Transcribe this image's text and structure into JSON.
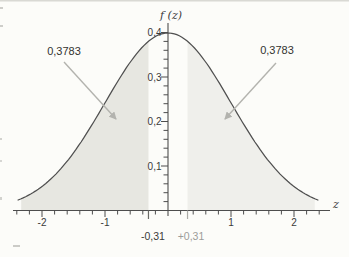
{
  "chart_data": {
    "type": "area",
    "title": "",
    "curve_name": "standard normal density",
    "mean": 0,
    "sd": 1,
    "peak": 0.3989,
    "xlabel": "z",
    "ylabel": "f (z)",
    "xlim": [
      -2.5,
      2.6
    ],
    "ylim": [
      0,
      0.42
    ],
    "curve_x_range": [
      -2.38,
      2.38
    ],
    "x_minor_step": 0.2,
    "y_minor_step": 0.02,
    "x_major_ticks": [
      {
        "value": -2,
        "label": "-2"
      },
      {
        "value": -1,
        "label": "-1"
      },
      {
        "value": 1,
        "label": "1"
      },
      {
        "value": 2,
        "label": "2"
      }
    ],
    "y_major_ticks": [
      {
        "value": 0.1,
        "label": "0,1"
      },
      {
        "value": 0.2,
        "label": "0,2"
      },
      {
        "value": 0.3,
        "label": "0,3"
      },
      {
        "value": 0.4,
        "label": "0,4"
      }
    ],
    "boundaries": [
      {
        "z": -0.31,
        "label": "-0,31",
        "tick_color": "#6a6a66",
        "label_color": "#3a3a3a"
      },
      {
        "z": 0.31,
        "label": "+0,31",
        "tick_color": "#ababa7",
        "label_color": "#9c9c99"
      }
    ],
    "shaded_regions": [
      {
        "from": -2.33,
        "to": -0.31,
        "area": 0.3783,
        "label": "0,3783",
        "fill": "#e7e7e1"
      },
      {
        "from": 0.31,
        "to": 2.33,
        "area": 0.3783,
        "label": "0,3783",
        "fill": "#efefeb"
      }
    ],
    "colors": {
      "background": "#fcfcf9",
      "curve": "#4f4f4f",
      "axis": "#4d4d4d",
      "arrow": "#b3b3ae",
      "text": "#3a3a3a",
      "muted_text": "#9c9c99"
    }
  }
}
